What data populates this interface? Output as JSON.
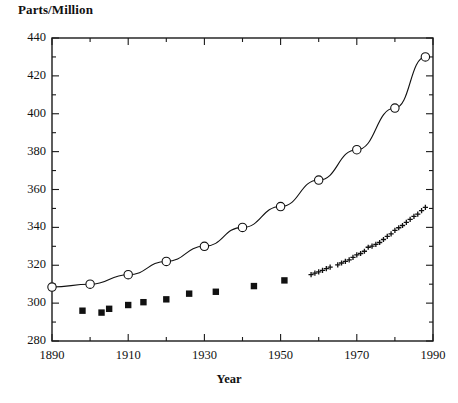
{
  "chart_data": {
    "type": "scatter",
    "title": "",
    "xlabel": "Year",
    "ylabel": "Parts/Million",
    "xlim": [
      1890,
      1990
    ],
    "ylim": [
      280,
      440
    ],
    "xticks": [
      1890,
      1910,
      1930,
      1950,
      1970,
      1990
    ],
    "xticklabels": [
      "1890",
      "1910",
      "1930",
      "1950",
      "1970",
      "1990"
    ],
    "xminorticks": [
      1900,
      1920,
      1940,
      1960,
      1980
    ],
    "yticks": [
      280,
      300,
      320,
      340,
      360,
      380,
      400,
      420,
      440
    ],
    "yticklabels": [
      "280",
      "300",
      "320",
      "340",
      "360",
      "380",
      "400",
      "420",
      "440"
    ],
    "yminorticks": [
      290,
      310,
      330,
      350,
      370,
      390,
      410,
      430
    ],
    "grid": false,
    "legend": "none",
    "frame": "box",
    "series": [
      {
        "name": "projected-curve-open-circles",
        "marker": "open-circle",
        "line": "solid",
        "color": "#111111",
        "x": [
          1890,
          1900,
          1910,
          1920,
          1930,
          1940,
          1950,
          1960,
          1970,
          1980,
          1988
        ],
        "y": [
          308.5,
          310,
          315,
          322,
          330,
          340,
          351,
          365,
          381,
          403,
          430
        ]
      },
      {
        "name": "ice-core-filled-squares",
        "marker": "filled-square",
        "line": "none",
        "color": "#111111",
        "x": [
          1898,
          1903,
          1905,
          1910,
          1914,
          1920,
          1926,
          1933,
          1943,
          1951
        ],
        "y": [
          296,
          295,
          297,
          299,
          300.5,
          302,
          305,
          306,
          309,
          312
        ]
      },
      {
        "name": "mauna-loa-plus-markers",
        "marker": "plus",
        "line": "none",
        "color": "#111111",
        "x": [
          1958,
          1959,
          1960,
          1961,
          1962,
          1963,
          1965,
          1966,
          1967,
          1968,
          1969,
          1970,
          1971,
          1972,
          1973,
          1974,
          1975,
          1976,
          1977,
          1978,
          1979,
          1980,
          1981,
          1982,
          1983,
          1984,
          1985,
          1986,
          1987,
          1988
        ],
        "y": [
          315,
          315.8,
          316.5,
          317.3,
          318.2,
          319.0,
          320.2,
          321.2,
          322.0,
          322.8,
          324.2,
          325.5,
          326.2,
          327.4,
          329.5,
          330.1,
          331.0,
          332.0,
          333.6,
          335.2,
          336.6,
          338.4,
          339.8,
          341.0,
          342.6,
          344.2,
          345.8,
          347.0,
          348.8,
          350.6
        ]
      }
    ]
  },
  "axis_geometry": {
    "plot_left_px": 52,
    "plot_right_px": 433,
    "plot_top_px": 38,
    "plot_bottom_px": 341
  }
}
